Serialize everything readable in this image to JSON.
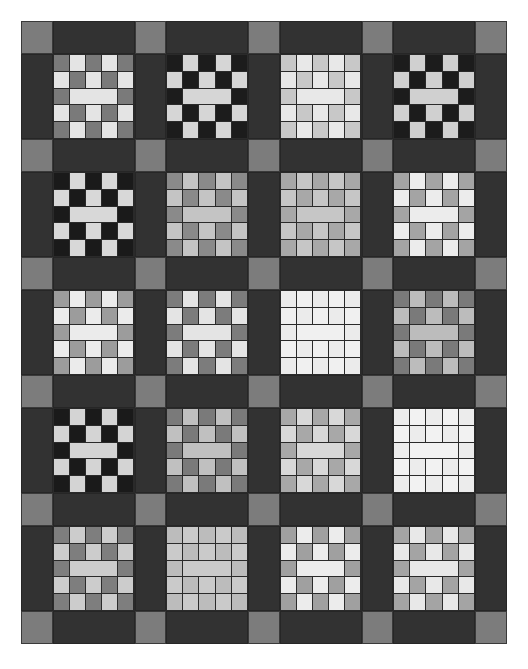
{
  "layout": {
    "block_rows": 5,
    "block_cols": 4,
    "sash_color": "#323232",
    "cornerstone_color": "#7c7c7c"
  },
  "block_pattern": {
    "description": "5x5 grid: alternating dark/light checker with merged light center bar in middle row",
    "rows": [
      [
        "D",
        "L",
        "D",
        "L",
        "D"
      ],
      [
        "L",
        "D",
        "L",
        "D",
        "L"
      ],
      [
        "D",
        "LLL",
        "D"
      ],
      [
        "L",
        "D",
        "L",
        "D",
        "L"
      ],
      [
        "D",
        "L",
        "D",
        "L",
        "D"
      ]
    ]
  },
  "blocks": [
    [
      {
        "dark": "#7a7a7a",
        "light": "#e4e4e4"
      },
      {
        "dark": "#1c1c1c",
        "light": "#d6d6d6"
      },
      {
        "dark": "#c8c8c8",
        "light": "#e8e8e8"
      },
      {
        "dark": "#1c1c1c",
        "light": "#d0d0d0"
      }
    ],
    [
      {
        "dark": "#1a1a1a",
        "light": "#d8d8d8"
      },
      {
        "dark": "#8a8a8a",
        "light": "#c4c4c4"
      },
      {
        "dark": "#a8a8a8",
        "light": "#c6c6c6"
      },
      {
        "dark": "#a4a4a4",
        "light": "#ececec"
      }
    ],
    [
      {
        "dark": "#9c9c9c",
        "light": "#ebebeb"
      },
      {
        "dark": "#7c7c7c",
        "light": "#e4e4e4"
      },
      {
        "dark": "#ebebeb",
        "light": "#f0f0f0"
      },
      {
        "dark": "#7a7a7a",
        "light": "#bcbcbc"
      }
    ],
    [
      {
        "dark": "#1a1a1a",
        "light": "#d4d4d4"
      },
      {
        "dark": "#7a7a7a",
        "light": "#c0c0c0"
      },
      {
        "dark": "#a8a8a8",
        "light": "#d8d8d8"
      },
      {
        "dark": "#ececec",
        "light": "#f2f2f2"
      }
    ],
    [
      {
        "dark": "#7e7e7e",
        "light": "#cccccc"
      },
      {
        "dark": "#bcbcbc",
        "light": "#cacaca"
      },
      {
        "dark": "#a0a0a0",
        "light": "#ececec"
      },
      {
        "dark": "#a4a4a4",
        "light": "#e8e8e8"
      }
    ]
  ]
}
